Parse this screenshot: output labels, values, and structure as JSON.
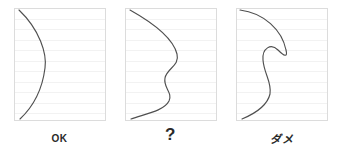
{
  "figure": {
    "title": "",
    "background_color": "#ffffff",
    "curve_color": "#4f4f4f",
    "border_color": "#dcdcdc",
    "rule_color": "#f2f2f2",
    "label_color": "#2a2a2a",
    "rule_count": 10,
    "panel_width": 92,
    "panel_height": 113
  },
  "panels": [
    {
      "id": "panel-ok",
      "label": "OK",
      "label_style": "text",
      "curve_name": "monotonic-convex-curve",
      "description": "single smooth convex curve bulging to the right, from top-left corner to bottom-left corner",
      "path": "M 5 2 C 26 22, 33 46, 31 60 C 29 76, 22 96, 6 111"
    },
    {
      "id": "panel-question",
      "label": "?",
      "label_style": "qmark",
      "curve_name": "s-wiggle-curve",
      "description": "curve with an S-shaped inflection in the middle, still a single-valued profile",
      "path": "M 5 2 C 30 16, 48 30, 52 46 C 55 58, 42 60, 40 70 C 38 80, 48 84, 44 93 C 39 103, 20 106, 6 111"
    },
    {
      "id": "panel-dame",
      "label": "ダメ",
      "label_style": "kana",
      "curve_name": "self-overlapping-cusp-curve",
      "description": "curve that sweeps far right then folds back on itself forming a sharp cusp and hook, an invalid overhanging profile",
      "path": "M 4 2 C 28 5, 46 22, 50 42 C 52 50, 48 48, 42 42 C 35 35, 26 40, 27 52 C 28 66, 36 74, 34 86 C 31 99, 18 106, 6 111"
    }
  ]
}
